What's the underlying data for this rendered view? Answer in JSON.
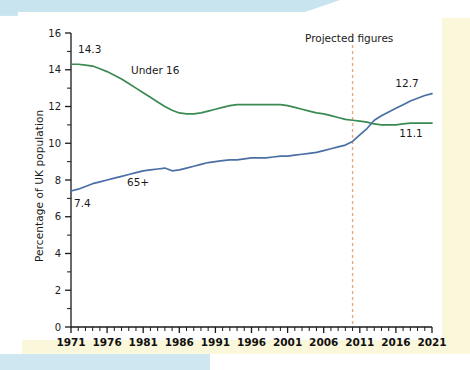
{
  "chart_data": {
    "type": "line",
    "title": "",
    "xlabel": "",
    "ylabel": "Percentage of UK population",
    "xlim": [
      1971,
      2021
    ],
    "ylim": [
      0,
      16
    ],
    "ytick_labels": [
      "0",
      "2",
      "4",
      "6",
      "8",
      "10",
      "12",
      "14",
      "16"
    ],
    "ytick_values": [
      0,
      2,
      4,
      6,
      8,
      10,
      12,
      14,
      16
    ],
    "y_minor_step": 1,
    "xtick_labels": [
      "1971",
      "1976",
      "1981",
      "1986",
      "1991",
      "1996",
      "2001",
      "2006",
      "2011",
      "2016",
      "2021"
    ],
    "xtick_values": [
      1971,
      1976,
      1981,
      1986,
      1991,
      1996,
      2001,
      2006,
      2011,
      2016,
      2021
    ],
    "x_minor_step": 1,
    "grid": false,
    "legend_position": "inline-labels",
    "annotations": [
      {
        "name": "projected-figures",
        "text": "Projected figures",
        "x": 2010,
        "type": "vline-label"
      },
      {
        "name": "under16-start-value",
        "text": "14.3",
        "x": 1971,
        "y": 14.3
      },
      {
        "name": "over65-start-value",
        "text": "7.4",
        "x": 1971,
        "y": 7.4
      },
      {
        "name": "over65-end-value",
        "text": "12.7",
        "x": 2021,
        "y": 12.7
      },
      {
        "name": "under16-end-value",
        "text": "11.1",
        "x": 2021,
        "y": 11.1
      }
    ],
    "projection_line": {
      "x": 2010,
      "color": "#e8a87c",
      "style": "dashed"
    },
    "x": [
      1971,
      1972,
      1973,
      1974,
      1975,
      1976,
      1977,
      1978,
      1979,
      1980,
      1981,
      1982,
      1983,
      1984,
      1985,
      1986,
      1987,
      1988,
      1989,
      1990,
      1991,
      1992,
      1993,
      1994,
      1995,
      1996,
      1997,
      1998,
      1999,
      2000,
      2001,
      2002,
      2003,
      2004,
      2005,
      2006,
      2007,
      2008,
      2009,
      2010,
      2011,
      2012,
      2013,
      2014,
      2015,
      2016,
      2017,
      2018,
      2019,
      2020,
      2021
    ],
    "series": [
      {
        "name": "Under 16",
        "label": "Under 16",
        "color": "#3a8a52",
        "values": [
          14.3,
          14.3,
          14.25,
          14.2,
          14.05,
          13.9,
          13.7,
          13.5,
          13.25,
          13.0,
          12.75,
          12.5,
          12.25,
          12.0,
          11.8,
          11.65,
          11.6,
          11.6,
          11.65,
          11.75,
          11.85,
          11.95,
          12.05,
          12.1,
          12.1,
          12.1,
          12.1,
          12.1,
          12.1,
          12.1,
          12.05,
          11.95,
          11.85,
          11.75,
          11.65,
          11.6,
          11.5,
          11.4,
          11.3,
          11.25,
          11.2,
          11.15,
          11.05,
          11.0,
          11.0,
          11.0,
          11.05,
          11.1,
          11.1,
          11.1,
          11.1
        ]
      },
      {
        "name": "65+",
        "label": "65+",
        "color": "#4a6fa5",
        "values": [
          7.4,
          7.5,
          7.65,
          7.8,
          7.9,
          8.0,
          8.1,
          8.2,
          8.3,
          8.4,
          8.5,
          8.55,
          8.6,
          8.65,
          8.5,
          8.55,
          8.65,
          8.75,
          8.85,
          8.95,
          9.0,
          9.05,
          9.1,
          9.1,
          9.15,
          9.2,
          9.2,
          9.2,
          9.25,
          9.3,
          9.3,
          9.35,
          9.4,
          9.45,
          9.5,
          9.6,
          9.7,
          9.8,
          9.9,
          10.1,
          10.45,
          10.8,
          11.25,
          11.5,
          11.7,
          11.9,
          12.1,
          12.3,
          12.45,
          12.6,
          12.7
        ]
      }
    ]
  },
  "decor": {
    "blue_band": "#cde7f1",
    "yellow_band": "#fbf7da",
    "page_white": "#ffffff"
  }
}
